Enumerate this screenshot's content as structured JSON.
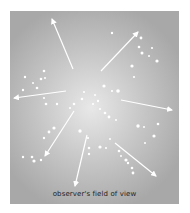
{
  "diagram": {
    "caption": "observer's field of view",
    "colors": {
      "background_center": "#e8e8e8",
      "background_edge": "#a8a8a8",
      "arrows": "#ffffff",
      "dots": "#ffffff",
      "caption_text": "#222222"
    },
    "arrows": [
      {
        "from": [
          73,
          69
        ],
        "to": [
          52,
          19
        ]
      },
      {
        "from": [
          101,
          71
        ],
        "to": [
          138,
          32
        ]
      },
      {
        "from": [
          66,
          91
        ],
        "to": [
          14,
          98
        ]
      },
      {
        "from": [
          121,
          100
        ],
        "to": [
          172,
          110
        ]
      },
      {
        "from": [
          74,
          111
        ],
        "to": [
          45,
          156
        ]
      },
      {
        "from": [
          87,
          135
        ],
        "to": [
          75,
          186
        ]
      },
      {
        "from": [
          115,
          143
        ],
        "to": [
          156,
          176
        ]
      }
    ],
    "dots": [
      {
        "x": 112,
        "y": 33,
        "r": 1.2
      },
      {
        "x": 141,
        "y": 38,
        "r": 1.4
      },
      {
        "x": 139,
        "y": 47,
        "r": 1.3
      },
      {
        "x": 142,
        "y": 53,
        "r": 1.5
      },
      {
        "x": 152,
        "y": 48,
        "r": 1.1
      },
      {
        "x": 149,
        "y": 56,
        "r": 1.0
      },
      {
        "x": 157,
        "y": 61,
        "r": 1.6
      },
      {
        "x": 132,
        "y": 66,
        "r": 1.6
      },
      {
        "x": 134,
        "y": 77,
        "r": 1.1
      },
      {
        "x": 44,
        "y": 71,
        "r": 1.3
      },
      {
        "x": 25,
        "y": 77,
        "r": 1.2
      },
      {
        "x": 41,
        "y": 79,
        "r": 1.3
      },
      {
        "x": 45,
        "y": 78,
        "r": 1.0
      },
      {
        "x": 33,
        "y": 83,
        "r": 1.0
      },
      {
        "x": 37,
        "y": 88,
        "r": 1.3
      },
      {
        "x": 23,
        "y": 90,
        "r": 1.2
      },
      {
        "x": 44,
        "y": 98,
        "r": 1.1
      },
      {
        "x": 46,
        "y": 104,
        "r": 1.3
      },
      {
        "x": 57,
        "y": 104,
        "r": 1.2
      },
      {
        "x": 82,
        "y": 99,
        "r": 1.3
      },
      {
        "x": 84,
        "y": 92,
        "r": 1.0
      },
      {
        "x": 95,
        "y": 95,
        "r": 1.0
      },
      {
        "x": 98,
        "y": 101,
        "r": 1.2
      },
      {
        "x": 104,
        "y": 86,
        "r": 1.6
      },
      {
        "x": 112,
        "y": 91,
        "r": 1.1
      },
      {
        "x": 118,
        "y": 91,
        "r": 1.8
      },
      {
        "x": 74,
        "y": 104,
        "r": 1.3
      },
      {
        "x": 70,
        "y": 108,
        "r": 1.0
      },
      {
        "x": 100,
        "y": 109,
        "r": 1.0
      },
      {
        "x": 93,
        "y": 104,
        "r": 1.1
      },
      {
        "x": 105,
        "y": 113,
        "r": 1.3
      },
      {
        "x": 109,
        "y": 117,
        "r": 1.4
      },
      {
        "x": 116,
        "y": 120,
        "r": 1.0
      },
      {
        "x": 54,
        "y": 128,
        "r": 1.6
      },
      {
        "x": 49,
        "y": 132,
        "r": 1.4
      },
      {
        "x": 44,
        "y": 138,
        "r": 1.2
      },
      {
        "x": 80,
        "y": 131,
        "r": 1.7
      },
      {
        "x": 138,
        "y": 126,
        "r": 1.7
      },
      {
        "x": 144,
        "y": 127,
        "r": 1.0
      },
      {
        "x": 158,
        "y": 124,
        "r": 1.3
      },
      {
        "x": 154,
        "y": 136,
        "r": 1.6
      },
      {
        "x": 145,
        "y": 143,
        "r": 1.0
      },
      {
        "x": 88,
        "y": 138,
        "r": 1.1
      },
      {
        "x": 89,
        "y": 148,
        "r": 1.3
      },
      {
        "x": 89,
        "y": 154,
        "r": 1.2
      },
      {
        "x": 100,
        "y": 147,
        "r": 1.6
      },
      {
        "x": 106,
        "y": 148,
        "r": 1.0
      },
      {
        "x": 110,
        "y": 139,
        "r": 1.0
      },
      {
        "x": 119,
        "y": 151,
        "r": 1.3
      },
      {
        "x": 121,
        "y": 156,
        "r": 1.0
      },
      {
        "x": 126,
        "y": 160,
        "r": 1.6
      },
      {
        "x": 128,
        "y": 163,
        "r": 1.2
      },
      {
        "x": 132,
        "y": 168,
        "r": 1.3
      },
      {
        "x": 133,
        "y": 173,
        "r": 1.4
      },
      {
        "x": 23,
        "y": 157,
        "r": 1.2
      },
      {
        "x": 32,
        "y": 157,
        "r": 1.3
      },
      {
        "x": 34,
        "y": 161,
        "r": 1.6
      },
      {
        "x": 41,
        "y": 160,
        "r": 1.2
      }
    ]
  }
}
